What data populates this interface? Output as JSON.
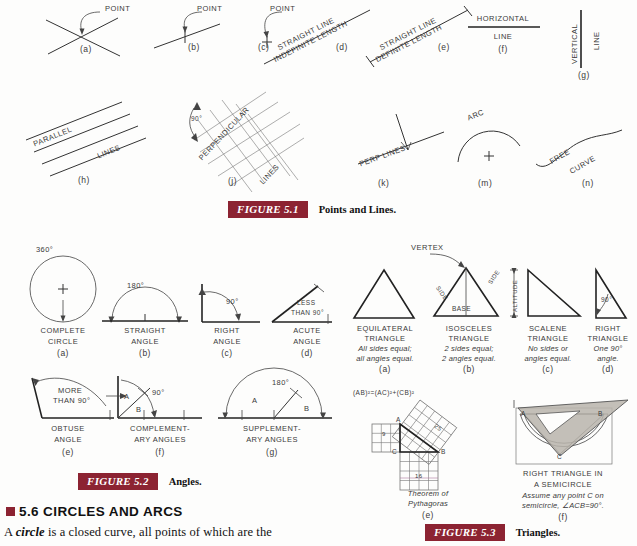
{
  "figures": [
    {
      "id": "fig-5-1",
      "tag": "FIGURE 5.1",
      "caption": "Points and Lines.",
      "items": [
        {
          "key": "a",
          "index": "(a)",
          "label": "POINT",
          "desc": "two crossing lines meeting at a point"
        },
        {
          "key": "b",
          "index": "(b)",
          "label": "POINT",
          "desc": "tick mark on a line"
        },
        {
          "key": "c",
          "index": "(c)",
          "label": "POINT",
          "desc": "small cross mark"
        },
        {
          "key": "d",
          "index": "(d)",
          "label_1": "STRAIGHT LINE",
          "label_2": "INDEFINITE LENGTH"
        },
        {
          "key": "e",
          "index": "(e)",
          "label_1": "STRAIGHT LINE",
          "label_2": "DEFINITE LENGTH"
        },
        {
          "key": "f",
          "index": "(f)",
          "label_1": "HORIZONTAL",
          "label_2": "LINE"
        },
        {
          "key": "g",
          "index": "(g)",
          "label_1": "VERTICAL",
          "label_2": "LINE"
        },
        {
          "key": "h",
          "index": "(h)",
          "label_1": "PARALLEL",
          "label_2": "LINES"
        },
        {
          "key": "j",
          "index": "(j)",
          "label_1": "PERPENDICULAR",
          "label_2": "LINES",
          "angle": "90°"
        },
        {
          "key": "k",
          "index": "(k)",
          "label": "PERP LINES"
        },
        {
          "key": "m",
          "index": "(m)",
          "label": "ARC"
        },
        {
          "key": "n",
          "index": "(n)",
          "label_1": "FREE",
          "label_2": "CURVE"
        }
      ]
    },
    {
      "id": "fig-5-2",
      "tag": "FIGURE 5.2",
      "caption": "Angles.",
      "items": [
        {
          "key": "a",
          "index": "(a)",
          "name_1": "COMPLETE",
          "name_2": "CIRCLE",
          "value": "360°"
        },
        {
          "key": "b",
          "index": "(b)",
          "name_1": "STRAIGHT",
          "name_2": "ANGLE",
          "value": "180°"
        },
        {
          "key": "c",
          "index": "(c)",
          "name_1": "RIGHT",
          "name_2": "ANGLE",
          "value": "90°"
        },
        {
          "key": "d",
          "index": "(d)",
          "name_1": "ACUTE",
          "name_2": "ANGLE",
          "value_1": "LESS",
          "value_2": "THAN 90°"
        },
        {
          "key": "e",
          "index": "(e)",
          "name_1": "OBTUSE",
          "name_2": "ANGLE",
          "value_1": "MORE",
          "value_2": "THAN 90°"
        },
        {
          "key": "f",
          "index": "(f)",
          "name_1": "COMPLEMENT-",
          "name_2": "ARY ANGLES",
          "value": "90°",
          "part_a": "A",
          "part_b": "B"
        },
        {
          "key": "g",
          "index": "(g)",
          "name_1": "SUPPLEMENT-",
          "name_2": "ARY ANGLES",
          "value": "180°",
          "part_a": "A",
          "part_b": "B"
        }
      ]
    },
    {
      "id": "fig-5-3",
      "tag": "FIGURE 5.3",
      "caption": "Triangles.",
      "items": [
        {
          "key": "a",
          "index": "(a)",
          "name_1": "EQUILATERAL",
          "name_2": "TRIANGLE",
          "note_1": "All sides equal;",
          "note_2": "all angles equal."
        },
        {
          "key": "b",
          "index": "(b)",
          "name_1": "ISOSCELES",
          "name_2": "TRIANGLE",
          "note_1": "2 sides equal;",
          "note_2": "2 angles equal.",
          "vertex": "VERTEX",
          "side_left": "SIDE",
          "side_right": "SIDE",
          "base": "BASE"
        },
        {
          "key": "c",
          "index": "(c)",
          "name_1": "SCALENE",
          "name_2": "TRIANGLE",
          "note_1": "No sides or",
          "note_2": "angles equal.",
          "altitude": "ALTITUDE"
        },
        {
          "key": "d",
          "index": "(d)",
          "name_1": "RIGHT",
          "name_2": "TRIANGLE",
          "note_1": "One 90°",
          "note_2": "angle.",
          "angle": "90°"
        },
        {
          "key": "e",
          "index": "(e)",
          "formula": "(AB)²=(AC)²+(CB)²",
          "note_1": "Theorem of",
          "note_2": "Pythagoras",
          "pt_a": "A",
          "pt_b": "B",
          "pt_c": "C",
          "sq_small": "9",
          "sq_base": "16",
          "sq_hyp": "25"
        },
        {
          "key": "f",
          "index": "(f)",
          "name_1": "RIGHT TRIANGLE IN",
          "name_2": "A SEMICIRCLE",
          "note_1": "Assume any point C on",
          "note_2": "semicircle, ∠ACB=90°.",
          "pt_a": "A",
          "pt_b": "B",
          "pt_c": "C"
        }
      ]
    }
  ],
  "section": {
    "number_title": "5.6  CIRCLES AND ARCS",
    "body_before": "A ",
    "body_italic": "circle",
    "body_after": " is a closed curve, all points of which are the"
  },
  "colors": {
    "accent": "#8c2332",
    "ink": "#333333",
    "page": "#fdfdfc",
    "triangle_fill": "#b8b4ac"
  }
}
